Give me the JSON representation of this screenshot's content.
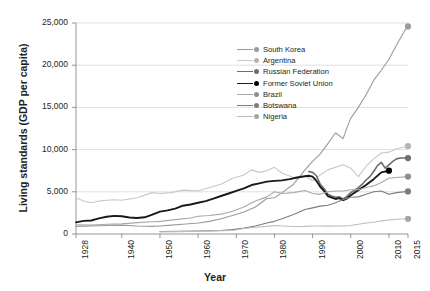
{
  "chart_data": {
    "type": "line",
    "title": "",
    "xlabel": "Year",
    "ylabel": "Living standards (GDP per capita)",
    "xlim": [
      1928,
      2015
    ],
    "ylim": [
      0,
      25000
    ],
    "grid": true,
    "legend_position": "inside-upper-center",
    "y_ticks": [
      "0",
      "5,000",
      "10,000",
      "15,000",
      "20,000",
      "25,000"
    ],
    "y_tick_values": [
      0,
      5000,
      10000,
      15000,
      20000,
      25000
    ],
    "x_ticks": [
      "1928",
      "1940",
      "1950",
      "1960",
      "1970",
      "1980",
      "1990",
      "2000",
      "2010",
      "2015"
    ],
    "x_tick_values": [
      1928,
      1940,
      1950,
      1960,
      1970,
      1980,
      1990,
      2000,
      2010,
      2015
    ],
    "series": [
      {
        "name": "South Korea",
        "color": "#9b9b9b",
        "marker_color": "#9b9b9b",
        "width": 1.1,
        "end_marker": true,
        "x": [
          1928,
          1932,
          1936,
          1940,
          1944,
          1948,
          1950,
          1953,
          1956,
          1960,
          1963,
          1966,
          1969,
          1972,
          1975,
          1978,
          1980,
          1982,
          1985,
          1988,
          1990,
          1992,
          1994,
          1996,
          1998,
          1999,
          2000,
          2002,
          2004,
          2006,
          2008,
          2010,
          2012,
          2014,
          2015
        ],
        "y": [
          900,
          950,
          1000,
          1050,
          950,
          900,
          950,
          1050,
          1150,
          1300,
          1500,
          1800,
          2200,
          2600,
          3200,
          4200,
          4300,
          4900,
          5900,
          7600,
          8600,
          9500,
          10700,
          12000,
          11300,
          12600,
          13700,
          15000,
          16500,
          18200,
          19400,
          20700,
          22400,
          24000,
          24600
        ]
      },
      {
        "name": "Argentina",
        "color": "#c7c7c7",
        "marker_color": "#b5b5b5",
        "width": 1.1,
        "end_marker": true,
        "x": [
          1928,
          1930,
          1932,
          1934,
          1936,
          1938,
          1940,
          1944,
          1948,
          1950,
          1953,
          1956,
          1960,
          1963,
          1966,
          1969,
          1972,
          1974,
          1976,
          1978,
          1980,
          1982,
          1985,
          1988,
          1990,
          1992,
          1994,
          1996,
          1998,
          2000,
          2002,
          2004,
          2006,
          2008,
          2010,
          2012,
          2015
        ],
        "y": [
          4300,
          3900,
          3700,
          3900,
          4000,
          4050,
          4000,
          4300,
          4900,
          4800,
          4900,
          5200,
          5100,
          5500,
          5900,
          6600,
          7000,
          7600,
          7300,
          7500,
          7900,
          7200,
          6700,
          6900,
          6300,
          7000,
          7600,
          7900,
          8200,
          7800,
          6800,
          8000,
          8900,
          9600,
          9700,
          10100,
          10400
        ]
      },
      {
        "name": "Russian Federation",
        "color": "#6e6e6e",
        "marker_color": "#6e6e6e",
        "width": 1.6,
        "end_marker": true,
        "x": [
          1989,
          1990,
          1991,
          1992,
          1993,
          1994,
          1995,
          1996,
          1997,
          1998,
          1999,
          2000,
          2001,
          2002,
          2003,
          2004,
          2005,
          2006,
          2007,
          2008,
          2009,
          2010,
          2011,
          2012,
          2013,
          2014,
          2015
        ],
        "y": [
          7400,
          7300,
          6900,
          5900,
          5400,
          4700,
          4500,
          4350,
          4400,
          4150,
          4450,
          4900,
          5200,
          5500,
          5900,
          6400,
          6800,
          7400,
          8100,
          8500,
          7800,
          8200,
          8600,
          8900,
          9000,
          9000,
          9000
        ]
      },
      {
        "name": "Former Soviet Union",
        "color": "#1a1a1a",
        "marker_color": "#000000",
        "width": 1.9,
        "end_marker": true,
        "x": [
          1928,
          1930,
          1932,
          1934,
          1936,
          1938,
          1940,
          1942,
          1944,
          1946,
          1948,
          1950,
          1952,
          1954,
          1956,
          1958,
          1960,
          1962,
          1964,
          1966,
          1968,
          1970,
          1972,
          1974,
          1976,
          1978,
          1980,
          1982,
          1984,
          1986,
          1988,
          1989,
          1990,
          1991,
          1992,
          1993,
          1994,
          1995,
          1996,
          1997,
          1998,
          1999,
          2000,
          2002,
          2004,
          2006,
          2008,
          2010
        ],
        "y": [
          1380,
          1550,
          1600,
          1850,
          2050,
          2150,
          2100,
          1950,
          1900,
          1980,
          2300,
          2650,
          2800,
          3000,
          3350,
          3500,
          3700,
          3900,
          4200,
          4500,
          4800,
          5100,
          5400,
          5800,
          6000,
          6200,
          6300,
          6350,
          6500,
          6700,
          6850,
          6900,
          6800,
          6300,
          5600,
          5100,
          4500,
          4300,
          4150,
          4250,
          4000,
          4200,
          4600,
          5200,
          5800,
          6500,
          7300,
          7500
        ]
      },
      {
        "name": "Brazil",
        "color": "#a9a9a9",
        "marker_color": "#8f8f8f",
        "width": 1.1,
        "end_marker": true,
        "x": [
          1928,
          1932,
          1936,
          1940,
          1944,
          1948,
          1950,
          1954,
          1958,
          1960,
          1963,
          1966,
          1969,
          1972,
          1975,
          1978,
          1980,
          1982,
          1985,
          1988,
          1990,
          1992,
          1994,
          1996,
          1998,
          2000,
          2002,
          2004,
          2006,
          2008,
          2010,
          2012,
          2015
        ],
        "y": [
          1100,
          1050,
          1150,
          1200,
          1350,
          1450,
          1500,
          1700,
          1900,
          2100,
          2200,
          2350,
          2700,
          3200,
          3900,
          4400,
          5000,
          4800,
          4900,
          5150,
          4800,
          4700,
          5000,
          5100,
          5100,
          5250,
          5250,
          5500,
          5700,
          6100,
          6600,
          6700,
          6800
        ]
      },
      {
        "name": "Botswana",
        "color": "#7d7d7d",
        "marker_color": "#7d7d7d",
        "width": 1.1,
        "end_marker": true,
        "x": [
          1950,
          1955,
          1960,
          1963,
          1966,
          1969,
          1972,
          1975,
          1978,
          1980,
          1982,
          1985,
          1988,
          1990,
          1992,
          1994,
          1996,
          1998,
          2000,
          2002,
          2004,
          2006,
          2008,
          2010,
          2012,
          2015
        ],
        "y": [
          300,
          320,
          350,
          380,
          420,
          520,
          700,
          950,
          1300,
          1500,
          1800,
          2300,
          2900,
          3100,
          3300,
          3400,
          3700,
          4100,
          4350,
          4400,
          4700,
          5000,
          5100,
          4700,
          4900,
          5050
        ]
      },
      {
        "name": "Nigeria",
        "color": "#bdbdbd",
        "marker_color": "#a5a5a5",
        "width": 1.1,
        "end_marker": true,
        "x": [
          1950,
          1955,
          1960,
          1963,
          1966,
          1969,
          1972,
          1975,
          1978,
          1980,
          1982,
          1985,
          1988,
          1990,
          1992,
          1994,
          1996,
          1998,
          2000,
          2002,
          2004,
          2006,
          2008,
          2010,
          2012,
          2015
        ],
        "y": [
          250,
          280,
          320,
          340,
          380,
          420,
          650,
          800,
          900,
          1000,
          950,
          880,
          900,
          950,
          950,
          930,
          950,
          960,
          1000,
          1150,
          1300,
          1400,
          1550,
          1650,
          1750,
          1800
        ]
      }
    ]
  }
}
